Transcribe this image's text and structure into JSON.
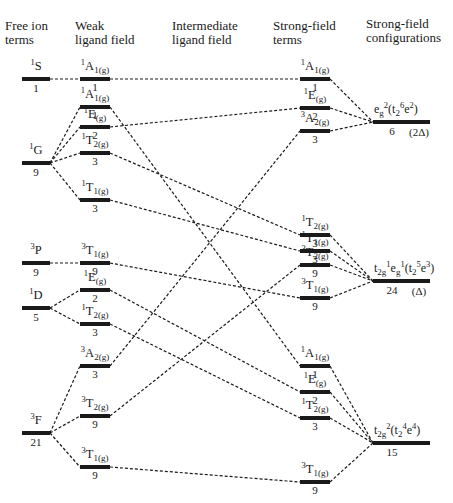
{
  "headers": {
    "free_ion": "Free ion\nterms",
    "weak": "Weak\nligand field",
    "intermediate": "Intermediate\nligand field",
    "strong_terms": "Strong-field\nterms",
    "strong_configs": "Strong-field\nconfigurations"
  },
  "free_ion_terms": [
    {
      "id": "1S",
      "mult": "1",
      "L": "S",
      "degeneracy": "1",
      "y": 79
    },
    {
      "id": "1G",
      "mult": "1",
      "L": "G",
      "degeneracy": "9",
      "y": 163
    },
    {
      "id": "3P",
      "mult": "3",
      "L": "P",
      "degeneracy": "9",
      "y": 263
    },
    {
      "id": "1D",
      "mult": "1",
      "L": "D",
      "degeneracy": "5",
      "y": 308
    },
    {
      "id": "3F",
      "mult": "3",
      "L": "F",
      "degeneracy": "21",
      "y": 433
    }
  ],
  "weak_field_terms": [
    {
      "id": "w1A1a",
      "mult": "1",
      "sym": "A",
      "sub": "1(g)",
      "degeneracy": "1",
      "y": 79,
      "from": "1S"
    },
    {
      "id": "w1A1b",
      "mult": "1",
      "sym": "A",
      "sub": "1(g)",
      "degeneracy": "1",
      "y": 107,
      "from": "1G"
    },
    {
      "id": "w1E1",
      "mult": "1",
      "sym": "E",
      "sub": "(g)",
      "degeneracy": "2",
      "y": 127,
      "from": "1G"
    },
    {
      "id": "w1T2a",
      "mult": "1",
      "sym": "T",
      "sub": "2(g)",
      "degeneracy": "3",
      "y": 153,
      "from": "1G"
    },
    {
      "id": "w1T1",
      "mult": "1",
      "sym": "T",
      "sub": "1(g)",
      "degeneracy": "3",
      "y": 200,
      "from": "1G"
    },
    {
      "id": "w3T1a",
      "mult": "3",
      "sym": "T",
      "sub": "1(g)",
      "degeneracy": "9",
      "y": 263,
      "from": "3P"
    },
    {
      "id": "w1E2",
      "mult": "1",
      "sym": "E",
      "sub": "(g)",
      "degeneracy": "2",
      "y": 290,
      "from": "1D"
    },
    {
      "id": "w1T2b",
      "mult": "1",
      "sym": "T",
      "sub": "2(g)",
      "degeneracy": "3",
      "y": 324,
      "from": "1D"
    },
    {
      "id": "w3A2",
      "mult": "3",
      "sym": "A",
      "sub": "2(g)",
      "degeneracy": "3",
      "y": 366,
      "from": "3F"
    },
    {
      "id": "w3T2",
      "mult": "3",
      "sym": "T",
      "sub": "2(g)",
      "degeneracy": "9",
      "y": 416,
      "from": "3F"
    },
    {
      "id": "w3T1b",
      "mult": "3",
      "sym": "T",
      "sub": "1(g)",
      "degeneracy": "9",
      "y": 467,
      "from": "3F"
    }
  ],
  "strong_field_terms": [
    {
      "id": "s1A1a",
      "mult": "1",
      "sym": "A",
      "sub": "1(g)",
      "degeneracy": "1",
      "y": 79,
      "config": "c1"
    },
    {
      "id": "s1Ea",
      "mult": "1",
      "sym": "E",
      "sub": "(g)",
      "degeneracy": "2",
      "y": 108,
      "config": "c1"
    },
    {
      "id": "s3A2",
      "mult": "3",
      "sym": "A",
      "sub": "2(g)",
      "degeneracy": "3",
      "y": 131,
      "config": "c1"
    },
    {
      "id": "s1T2a",
      "mult": "1",
      "sym": "T",
      "sub": "2(g)",
      "degeneracy": "3",
      "y": 235,
      "config": "c2"
    },
    {
      "id": "s1T1",
      "mult": "1",
      "sym": "T",
      "sub": "1(g)",
      "degeneracy": "3",
      "y": 251,
      "config": "c2"
    },
    {
      "id": "s3T2",
      "mult": "3",
      "sym": "T",
      "sub": "2(g)",
      "degeneracy": "9",
      "y": 265,
      "config": "c2"
    },
    {
      "id": "s3T1a",
      "mult": "3",
      "sym": "T",
      "sub": "1(g)",
      "degeneracy": "9",
      "y": 298,
      "config": "c2"
    },
    {
      "id": "s1A1b",
      "mult": "1",
      "sym": "A",
      "sub": "1(g)",
      "degeneracy": "1",
      "y": 366,
      "config": "c3"
    },
    {
      "id": "s1Eb",
      "mult": "1",
      "sym": "E",
      "sub": "(g)",
      "degeneracy": "2",
      "y": 392,
      "config": "c3"
    },
    {
      "id": "s1T2b",
      "mult": "1",
      "sym": "T",
      "sub": "2(g)",
      "degeneracy": "3",
      "y": 418,
      "config": "c3"
    },
    {
      "id": "s3T1b",
      "mult": "3",
      "sym": "T",
      "sub": "1(g)",
      "degeneracy": "9",
      "y": 482,
      "config": "c3"
    }
  ],
  "configurations": [
    {
      "id": "c1",
      "label_html": "e<sub>g</sub><sup>2</sup>(t<sub>2</sub><sup>6</sup>e<sup>2</sup>)",
      "degeneracy": "6",
      "energy": "(2Δ)",
      "y": 122
    },
    {
      "id": "c2",
      "label_html": "t<sub>2g</sub><sup>1</sup>e<sub>g</sub><sup>1</sup>(t<sub>2</sub><sup>5</sup>e<sup>3</sup>)",
      "degeneracy": "24",
      "energy": "(Δ)",
      "y": 281
    },
    {
      "id": "c3",
      "label_html": "t<sub>2g</sub><sup>2</sup>(t<sub>2</sub><sup>4</sup>e<sup>4</sup>)",
      "degeneracy": "15",
      "energy": "",
      "y": 443
    }
  ],
  "correlations": [
    [
      "w1A1a",
      "s1A1a"
    ],
    [
      "w1A1b",
      "s1A1b"
    ],
    [
      "w1E1",
      "s1Ea"
    ],
    [
      "w1T2a",
      "s1T2a"
    ],
    [
      "w1T1",
      "s1T1"
    ],
    [
      "w3T1a",
      "s3T1a"
    ],
    [
      "w1E2",
      "s1Eb"
    ],
    [
      "w1T2b",
      "s1T2b"
    ],
    [
      "w3A2",
      "s3A2"
    ],
    [
      "w3T2",
      "s3T2"
    ],
    [
      "w3T1b",
      "s3T1b"
    ]
  ],
  "colors": {
    "line": "#1a1a1a",
    "background": "#ffffff"
  }
}
